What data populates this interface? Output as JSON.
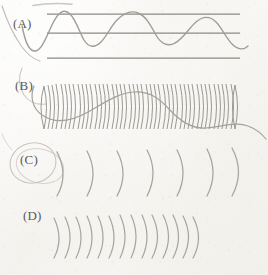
{
  "figure": {
    "background_color": "#f7f6f3",
    "ink_color": "#6e6b66",
    "width": 268,
    "height": 275
  },
  "panels": [
    {
      "key": "A",
      "label": "(A)",
      "label_x": 13,
      "label_y": 16,
      "content": "sine wave with three horizontal reference lines",
      "reference_lines": [
        {
          "y": 14,
          "x1": 47,
          "x2": 240
        },
        {
          "y": 33,
          "x1": 47,
          "x2": 240
        },
        {
          "y": 58,
          "x1": 47,
          "x2": 240
        }
      ],
      "wave": {
        "type": "sine",
        "baseline_y": 33,
        "amplitude": 19,
        "cycles": 2.6,
        "x_start": 22,
        "x_end": 248
      }
    },
    {
      "key": "B",
      "label": "(B)",
      "label_x": 15,
      "label_y": 78,
      "content": "dense coil / compressed spring with overlaid sine wave",
      "coil": {
        "arc_count": 46,
        "x_start": 44,
        "x_end": 236,
        "spacing": 4.2,
        "top_y": 84,
        "bottom_y": 128,
        "curvature": 5
      },
      "wave": {
        "type": "sine",
        "baseline_y": 108,
        "amplitude": 16,
        "cycles": 1.6,
        "x_start": 34,
        "x_end": 262
      }
    },
    {
      "key": "C",
      "label": "(C)",
      "label_x": 20,
      "label_y": 152,
      "content": "widely spaced wavefront arcs (long wavelength)",
      "arcs": {
        "count": 7,
        "x_start": 57,
        "spacing": 30,
        "top_y": 150,
        "bottom_y": 196,
        "curvature": 11
      }
    },
    {
      "key": "D",
      "label": "(D)",
      "label_x": 23,
      "label_y": 208,
      "content": "closely spaced wavefront arcs (short wavelength)",
      "arcs": {
        "count": 14,
        "x_start": 54,
        "spacing": 11,
        "top_y": 215,
        "bottom_y": 258,
        "curvature": 10
      }
    }
  ],
  "stray_marks": [
    {
      "name": "top-smudge-stroke",
      "x1": 33,
      "y1": 5,
      "x2": 72,
      "y2": 3
    },
    {
      "name": "left-edge-curve-a",
      "x1": 2,
      "y1": 8,
      "x2": 30,
      "y2": 60
    },
    {
      "name": "loop-scribble-c",
      "cx": 33,
      "cy": 163,
      "rx": 22,
      "ry": 19
    }
  ]
}
